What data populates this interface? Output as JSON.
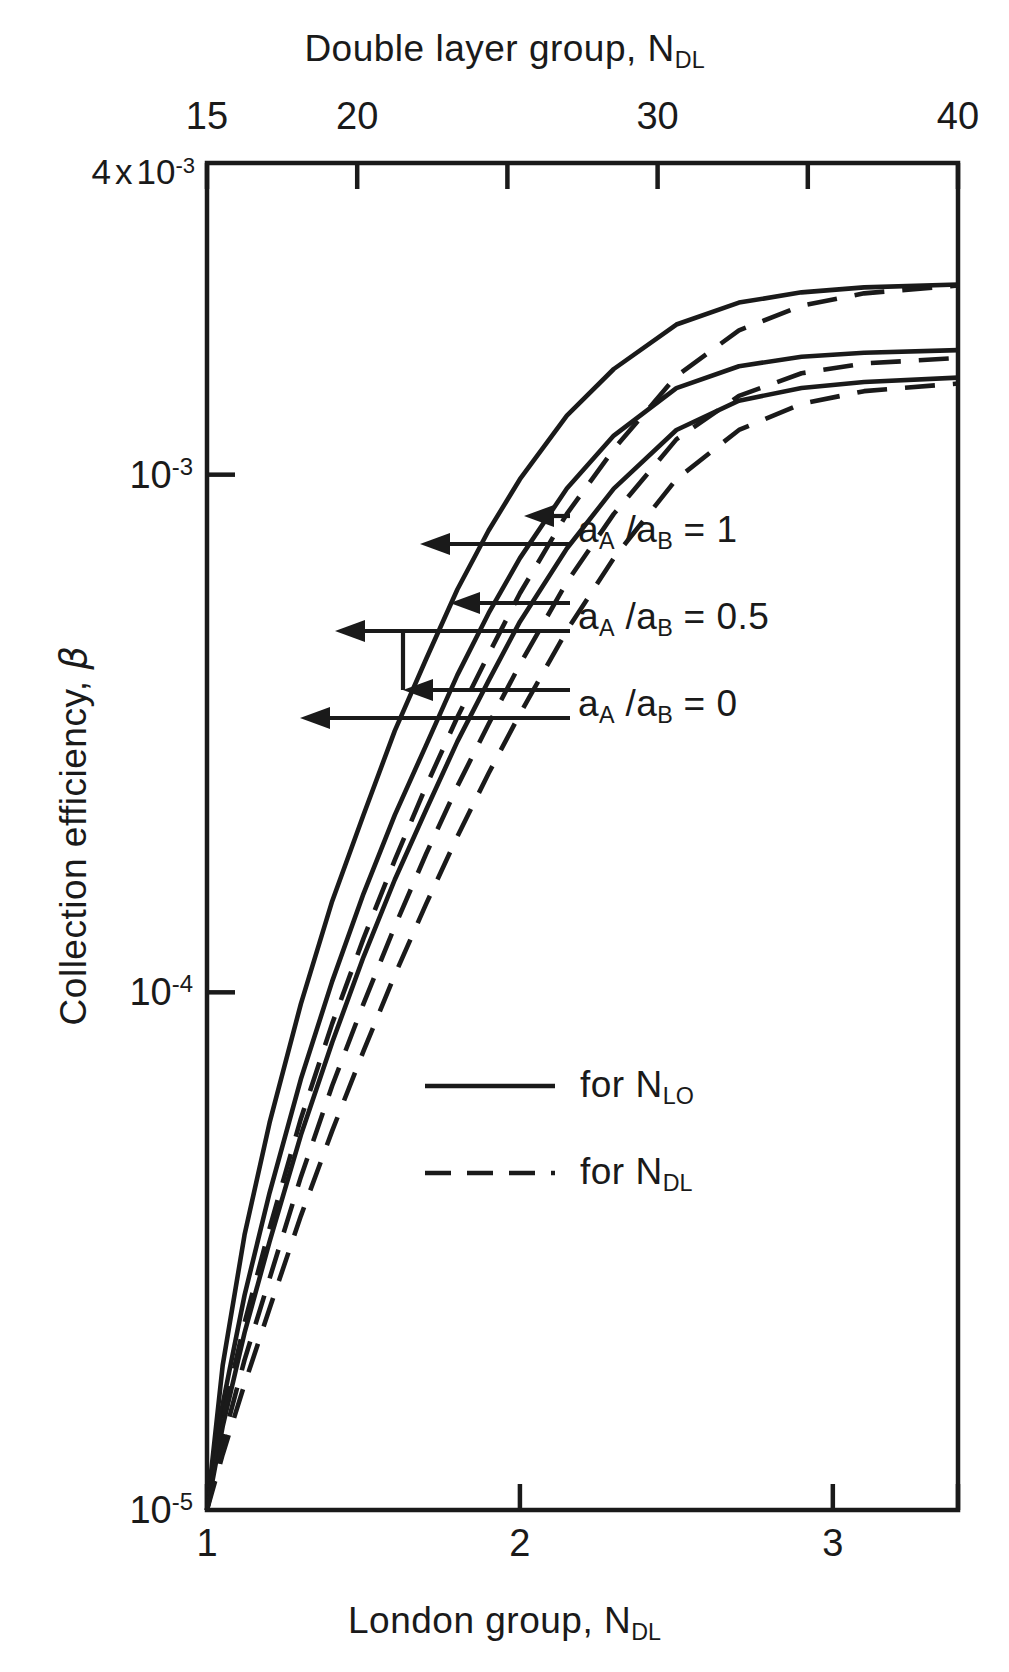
{
  "chart_data": {
    "type": "line",
    "title": "",
    "top_axis": {
      "label_prefix": "Double layer group, N",
      "label_sub": "DL",
      "ticks": [
        15,
        20,
        25,
        30,
        35,
        40
      ],
      "tick_labels": [
        "15",
        "20",
        "",
        "30",
        "",
        "40"
      ],
      "range": [
        15,
        40
      ]
    },
    "bottom_axis": {
      "label_prefix": "London group, N",
      "label_sub": "DL",
      "ticks": [
        1,
        2,
        3
      ],
      "tick_labels": [
        "1",
        "2",
        "3"
      ],
      "range": [
        1,
        3.4
      ]
    },
    "yaxis": {
      "label_prefix": "Collection efficiency, ",
      "label_symbol": "β",
      "scale": "log",
      "range": [
        1e-05,
        0.004
      ],
      "top_label_mantissa": "4",
      "top_label_times": "x",
      "top_label_base": "10",
      "top_label_exp": "-3",
      "ticks": [
        {
          "value": 0.001,
          "base": "10",
          "exp": "-3"
        },
        {
          "value": 0.0001,
          "base": "10",
          "exp": "-4"
        },
        {
          "value": 1e-05,
          "base": "10",
          "exp": "-5"
        }
      ]
    },
    "grid": false,
    "legend": {
      "position": "inside-lower-right",
      "entries": [
        {
          "style": "solid",
          "prefix": "for N",
          "sub": "LO"
        },
        {
          "style": "dashed",
          "prefix": "for N",
          "sub": "DL"
        }
      ]
    },
    "annotations": [
      {
        "prefix": "a",
        "sub1": "A",
        "slash": " /a",
        "sub2": "B",
        "eq": " = 1",
        "arrows": 2
      },
      {
        "prefix": "a",
        "sub1": "A",
        "slash": " /a",
        "sub2": "B",
        "eq": " = 0.5",
        "arrows": 2
      },
      {
        "prefix": "a",
        "sub1": "A",
        "slash": " /a",
        "sub2": "B",
        "eq": " = 0",
        "arrows": 2
      }
    ],
    "series": [
      {
        "name": "a_A/a_B = 1 (N_LO)",
        "style": "solid",
        "x": [
          1.0,
          1.05,
          1.12,
          1.2,
          1.3,
          1.4,
          1.5,
          1.6,
          1.7,
          1.8,
          1.9,
          2.0,
          2.15,
          2.3,
          2.5,
          2.7,
          2.9,
          3.1,
          3.4
        ],
        "y": [
          1e-05,
          1.9e-05,
          3.4e-05,
          5.6e-05,
          9.5e-05,
          0.00015,
          0.00022,
          0.00032,
          0.00044,
          0.0006,
          0.00078,
          0.00098,
          0.0013,
          0.0016,
          0.00195,
          0.00215,
          0.00225,
          0.0023,
          0.00233
        ]
      },
      {
        "name": "a_A/a_B = 0.5 (N_LO)",
        "style": "solid",
        "x": [
          1.0,
          1.05,
          1.12,
          1.2,
          1.3,
          1.4,
          1.5,
          1.6,
          1.7,
          1.8,
          1.9,
          2.0,
          2.15,
          2.3,
          2.5,
          2.7,
          2.9,
          3.1,
          3.4
        ],
        "y": [
          1e-05,
          1.6e-05,
          2.6e-05,
          4.1e-05,
          6.8e-05,
          0.000105,
          0.000155,
          0.00022,
          0.0003,
          0.00041,
          0.00054,
          0.00069,
          0.00094,
          0.00119,
          0.00147,
          0.00162,
          0.00169,
          0.00172,
          0.00174
        ]
      },
      {
        "name": "a_A/a_B = 0 (N_LO)",
        "style": "solid",
        "x": [
          1.0,
          1.05,
          1.12,
          1.2,
          1.3,
          1.4,
          1.5,
          1.6,
          1.7,
          1.8,
          1.9,
          2.0,
          2.15,
          2.3,
          2.5,
          2.7,
          2.9,
          3.1,
          3.4
        ],
        "y": [
          1e-05,
          1.45e-05,
          2.2e-05,
          3.3e-05,
          5.3e-05,
          8e-05,
          0.000117,
          0.000165,
          0.000225,
          0.000305,
          0.0004,
          0.00052,
          0.00072,
          0.00094,
          0.00122,
          0.00139,
          0.00147,
          0.00151,
          0.00154
        ]
      },
      {
        "name": "a_A/a_B = 1 (N_DL)",
        "style": "dashed",
        "x": [
          1.0,
          1.05,
          1.12,
          1.2,
          1.3,
          1.4,
          1.5,
          1.6,
          1.7,
          1.8,
          1.9,
          2.0,
          2.15,
          2.3,
          2.5,
          2.7,
          2.9,
          3.1,
          3.4
        ],
        "y": [
          1e-05,
          1.5e-05,
          2.3e-05,
          3.5e-05,
          5.7e-05,
          8.7e-05,
          0.000127,
          0.00018,
          0.00025,
          0.00034,
          0.00045,
          0.00059,
          0.00084,
          0.00112,
          0.00155,
          0.0019,
          0.00212,
          0.00224,
          0.00232
        ]
      },
      {
        "name": "a_A/a_B = 0.5 (N_DL)",
        "style": "dashed",
        "x": [
          1.0,
          1.05,
          1.12,
          1.2,
          1.3,
          1.4,
          1.5,
          1.6,
          1.7,
          1.8,
          1.9,
          2.0,
          2.15,
          2.3,
          2.5,
          2.7,
          2.9,
          3.1,
          3.4
        ],
        "y": [
          1e-05,
          1.35e-05,
          1.95e-05,
          2.8e-05,
          4.4e-05,
          6.6e-05,
          9.5e-05,
          0.000134,
          0.000185,
          0.00025,
          0.00033,
          0.00043,
          0.00062,
          0.00084,
          0.00117,
          0.00142,
          0.00157,
          0.00164,
          0.00168
        ]
      },
      {
        "name": "a_A/a_B = 0 (N_DL)",
        "style": "dashed",
        "x": [
          1.0,
          1.05,
          1.12,
          1.2,
          1.3,
          1.4,
          1.5,
          1.6,
          1.7,
          1.8,
          1.9,
          2.0,
          2.15,
          2.3,
          2.5,
          2.7,
          2.9,
          3.1,
          3.4
        ],
        "y": [
          1e-05,
          1.28e-05,
          1.75e-05,
          2.45e-05,
          3.7e-05,
          5.4e-05,
          7.7e-05,
          0.000108,
          0.000148,
          0.0002,
          0.000265,
          0.000345,
          0.0005,
          0.00069,
          0.00098,
          0.00122,
          0.00137,
          0.00145,
          0.0015
        ]
      }
    ]
  },
  "plot_area": {
    "left": 207,
    "right": 958,
    "top": 163,
    "bottom": 1510
  }
}
